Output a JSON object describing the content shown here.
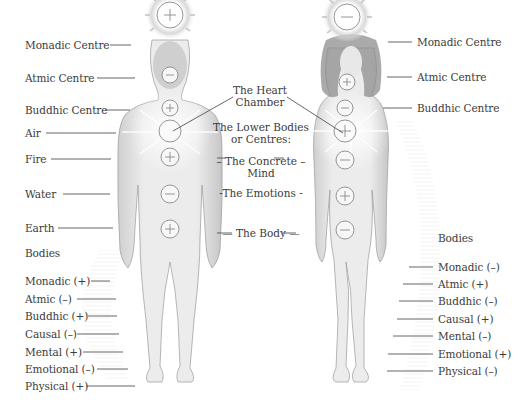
{
  "diagram": {
    "left_figure": {
      "label": "Male figure",
      "centres": [
        {
          "name": "Monadic Centre",
          "sign": "+",
          "y": 15
        },
        {
          "name": "Atmic Centre",
          "sign": "-",
          "y": 75
        },
        {
          "name": "Buddhic Centre",
          "sign": "+",
          "y": 108
        },
        {
          "name": "Air",
          "sign": "",
          "y": 131
        },
        {
          "name": "Fire",
          "sign": "+",
          "y": 157
        },
        {
          "name": "Water",
          "sign": "-",
          "y": 194
        },
        {
          "name": "Earth",
          "sign": "+",
          "y": 229
        }
      ],
      "centre_labels": [
        "Monadic Centre",
        "Atmic Centre",
        "Buddhic Centre",
        "Air",
        "Fire",
        "Water",
        "Earth"
      ],
      "bodies_heading": "Bodies",
      "bodies": [
        "Monadic (+)",
        "Atmic  (–)",
        "Buddhic (+)",
        "Causal (–)",
        "Mental (+)",
        "Emotional (–)",
        "Physical (+)"
      ]
    },
    "right_figure": {
      "label": "Female figure",
      "centres": [
        {
          "name": "Monadic Centre",
          "sign": "-"
        },
        {
          "name": "Atmic Centre",
          "sign": "+"
        },
        {
          "name": "Buddhic Centre",
          "sign": "-"
        },
        {
          "name": "Air",
          "sign": "+"
        },
        {
          "name": "Fire",
          "sign": "-"
        },
        {
          "name": "Water",
          "sign": "+"
        },
        {
          "name": "Earth",
          "sign": "-"
        }
      ],
      "centre_labels": [
        "Monadic Centre",
        "Atmic Centre",
        "Buddhic Centre"
      ],
      "bodies_heading": "Bodies",
      "bodies": [
        "Monadic (–)",
        "Atmic  (+)",
        "Buddhic (–)",
        "Causal (+)",
        "Mental (–)",
        "Emotional (+)",
        "Physical (–)"
      ]
    },
    "middle": {
      "heart_chamber": "The Heart\nChamber",
      "lower_bodies": "The Lower Bodies\nor Centres:",
      "concrete_mind": "– The Concrete –\nMind",
      "emotions": "-The Emotions -",
      "body": "— The Body —"
    },
    "colors": {
      "text": "#3b3b3b",
      "line": "#555555",
      "figure_fill": "#ececec",
      "figure_shade": "#c9c9c9",
      "hair": "#8a8a8a",
      "glow": "#d8d8d8"
    }
  }
}
